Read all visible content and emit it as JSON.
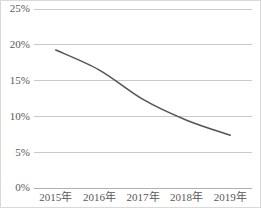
{
  "chart_data": {
    "type": "line",
    "title": "",
    "subtitle": "",
    "xlabel": "",
    "ylabel": "",
    "categories": [
      "2015年",
      "2016年",
      "2017年",
      "2018年",
      "2019年"
    ],
    "values": [
      19.2,
      16.4,
      12.3,
      9.4,
      7.3
    ],
    "series": [
      {
        "name": "",
        "values": [
          19.2,
          16.4,
          12.3,
          9.4,
          7.3
        ]
      }
    ],
    "ylim": [
      0,
      25
    ],
    "ytick_values": [
      0,
      5,
      10,
      15,
      20,
      25
    ],
    "ytick_labels": [
      "0%",
      "5%",
      "10%",
      "15%",
      "20%",
      "25%"
    ],
    "xtick_labels": [
      "2015年",
      "2016年",
      "2017年",
      "2018年",
      "2019年"
    ],
    "grid": true,
    "grid_axis": "y",
    "legend": false,
    "legend_position": "none",
    "value_unit": "%",
    "colors": {
      "line": "#555555",
      "gridline": "#c9c9c9",
      "axis": "#b0b0b0",
      "tick_text": "#595959",
      "background": "#ffffff",
      "frame": "#d9d9d9"
    }
  },
  "figure": {
    "name": "line-chart",
    "width": 261,
    "height": 208
  }
}
